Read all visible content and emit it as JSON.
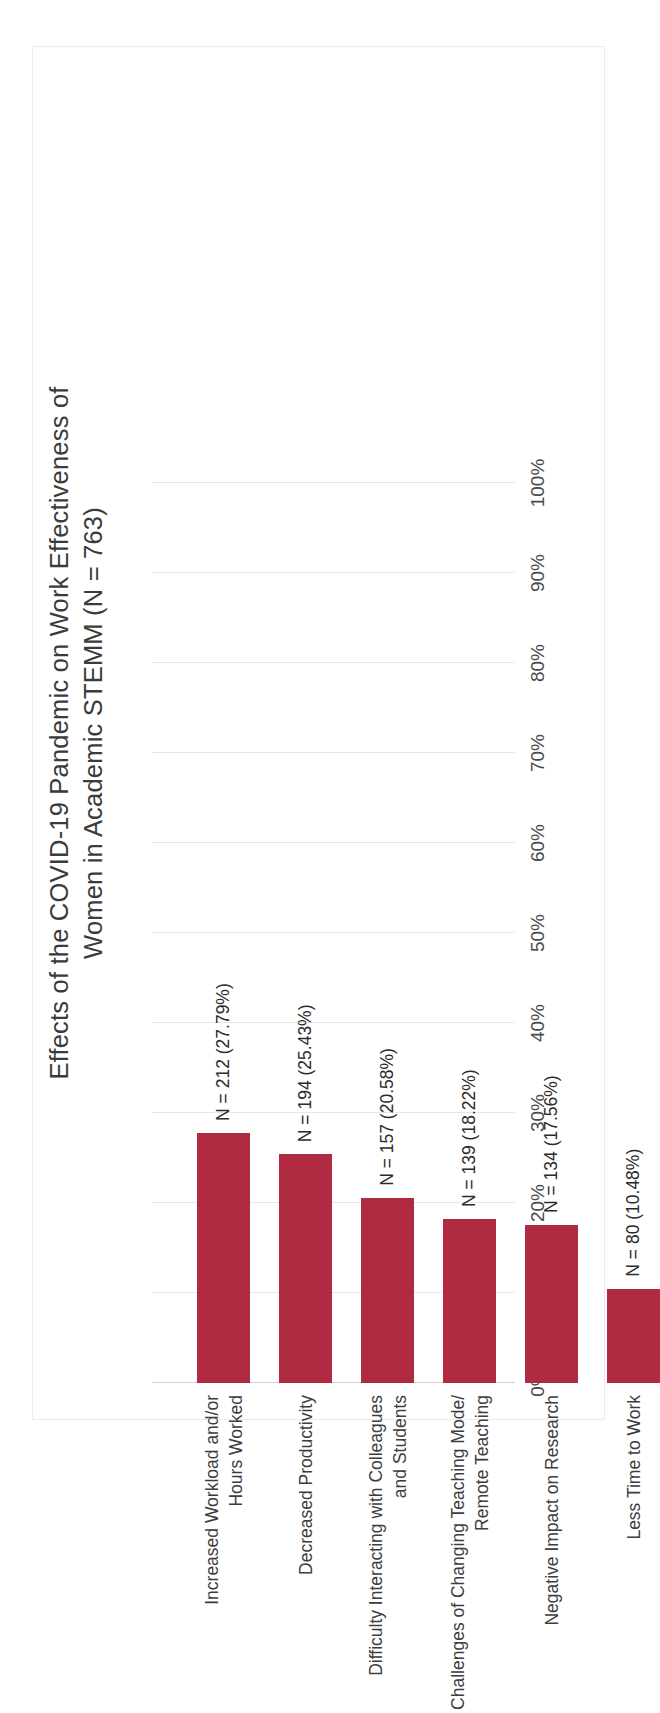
{
  "chart_data": {
    "type": "bar",
    "title": "Effects of the COVID-19 Pandemic on Work Effectiveness of Women in Academic STEMM (N = 763)",
    "title_line1": "Effects of the COVID-19 Pandemic on Work Effectiveness of",
    "title_line2": "Women in Academic STEMM (N = 763)",
    "xlabel": "",
    "ylabel": "",
    "ylim": [
      0,
      100
    ],
    "grid": true,
    "legend": "none",
    "orientation": "vertical-bars-rotated-90ccw",
    "bar_color": "#b02a42",
    "total_n": 763,
    "categories": [
      "Increased Workload and/or\nHours Worked",
      "Decreased Productivity",
      "Difficulty Interacting with Colleagues\nand Students",
      "Challenges of Changing Teaching Mode/\nRemote Teaching",
      "Negative Impact on Research",
      "Less Time to Work"
    ],
    "values": [
      27.79,
      25.43,
      20.58,
      18.22,
      17.56,
      10.48
    ],
    "counts": [
      212,
      194,
      157,
      139,
      134,
      80
    ],
    "data_labels": [
      "N = 212 (27.79%)",
      "N = 194 (25.43%)",
      "N = 157 (20.58%)",
      "N = 139 (18.22%)",
      "N = 134 (17.56%)",
      "N = 80 (10.48%)"
    ],
    "tick_values": [
      0,
      10,
      20,
      30,
      40,
      50,
      60,
      70,
      80,
      90,
      100
    ],
    "tick_labels": [
      "0%",
      "10%",
      "20%",
      "30%",
      "40%",
      "50%",
      "60%",
      "70%",
      "80%",
      "90%",
      "100%"
    ]
  }
}
